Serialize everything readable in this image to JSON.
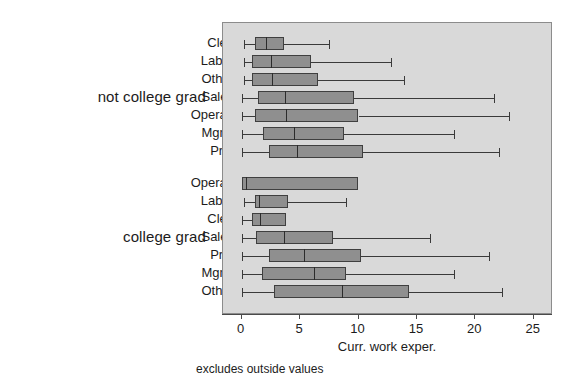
{
  "chart_data": {
    "type": "box",
    "title": "",
    "xlabel": "Curr. work exper.",
    "ylabel": "",
    "note": "excludes outside values",
    "xlim": [
      -0.6,
      26.5
    ],
    "xticks": [
      0,
      5,
      10,
      15,
      20,
      25
    ],
    "xticklabels": [
      "0",
      "5",
      "10",
      "15",
      "20",
      "25"
    ],
    "grid": false,
    "legend": "none",
    "orientation": "horizontal",
    "groups": [
      {
        "label": "not college grad",
        "boxes": [
          {
            "category": "Cler.",
            "whisker_low": 0.2,
            "q1": 1.1,
            "median": 2.1,
            "q3": 3.6,
            "whisker_high": 7.5
          },
          {
            "category": "Labor",
            "whisker_low": 0.2,
            "q1": 0.9,
            "median": 2.5,
            "q3": 5.9,
            "whisker_high": 12.8
          },
          {
            "category": "Other",
            "whisker_low": 0.2,
            "q1": 0.9,
            "median": 2.6,
            "q3": 6.5,
            "whisker_high": 13.9
          },
          {
            "category": "Sales",
            "whisker_low": 0.0,
            "q1": 1.4,
            "median": 3.7,
            "q3": 9.6,
            "whisker_high": 21.6
          },
          {
            "category": "Operat.",
            "whisker_low": 0.0,
            "q1": 1.1,
            "median": 3.8,
            "q3": 10.0,
            "whisker_high": 22.9
          },
          {
            "category": "Mgmt",
            "whisker_low": 0.0,
            "q1": 1.8,
            "median": 4.5,
            "q3": 8.8,
            "whisker_high": 18.2
          },
          {
            "category": "Prof",
            "whisker_low": 0.0,
            "q1": 2.3,
            "median": 4.7,
            "q3": 10.4,
            "whisker_high": 22.0
          }
        ]
      },
      {
        "label": "college grad",
        "boxes": [
          {
            "category": "Operat.",
            "whisker_low": 0.0,
            "q1": 0.0,
            "median": 0.4,
            "q3": 10.0,
            "whisker_high": 10.0
          },
          {
            "category": "Labor",
            "whisker_low": 0.2,
            "q1": 1.1,
            "median": 1.5,
            "q3": 4.0,
            "whisker_high": 8.9
          },
          {
            "category": "Cler.",
            "whisker_low": 0.0,
            "q1": 0.9,
            "median": 1.6,
            "q3": 3.8,
            "whisker_high": 3.8
          },
          {
            "category": "Sales",
            "whisker_low": 0.0,
            "q1": 1.2,
            "median": 3.6,
            "q3": 7.8,
            "whisker_high": 16.1
          },
          {
            "category": "Prof",
            "whisker_low": 0.0,
            "q1": 2.3,
            "median": 5.3,
            "q3": 10.2,
            "whisker_high": 21.2
          },
          {
            "category": "Mgmt",
            "whisker_low": 0.0,
            "q1": 1.7,
            "median": 6.2,
            "q3": 8.9,
            "whisker_high": 18.2
          },
          {
            "category": "Other",
            "whisker_low": 0.0,
            "q1": 2.8,
            "median": 8.6,
            "q3": 14.3,
            "whisker_high": 22.3
          }
        ]
      }
    ],
    "colors": {
      "plot_background": "#d9d9d9",
      "box_fill": "#8f8f8f",
      "box_edge": "#3f3f3f",
      "median": "#2c2c2c",
      "whisker": "#3a3a3a",
      "axis": "#4a4a4a",
      "text": "#1c1c1c"
    }
  }
}
